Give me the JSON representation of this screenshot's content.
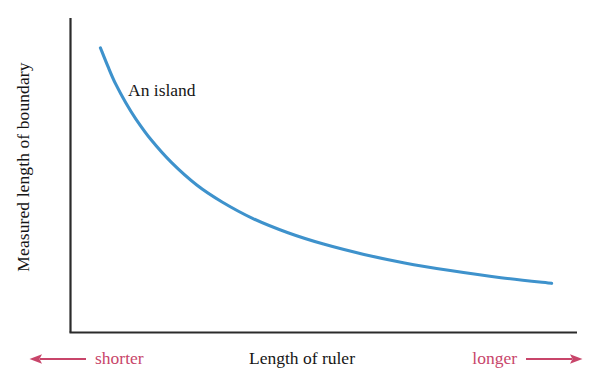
{
  "chart_data": {
    "type": "line",
    "title": "",
    "subtitle": "",
    "xlabel": "Length of ruler",
    "ylabel": "Measured length of boundary",
    "xlim": [
      0,
      1
    ],
    "ylim": [
      0,
      1
    ],
    "grid": false,
    "legend_position": "none",
    "axis_ticks": {
      "x": [],
      "y": []
    },
    "annotations": [
      {
        "text": "An island",
        "x": 0.12,
        "y": 0.84
      },
      {
        "text": "shorter",
        "x": 0.0,
        "y": -0.08,
        "color": "#c8456a",
        "arrow": "left"
      },
      {
        "text": "longer",
        "x": 1.0,
        "y": -0.08,
        "color": "#c8456a",
        "arrow": "right"
      }
    ],
    "series": [
      {
        "name": "An island",
        "color": "#3e92cc",
        "x": [
          0.06,
          0.075,
          0.09,
          0.11,
          0.13,
          0.16,
          0.2,
          0.25,
          0.3,
          0.36,
          0.43,
          0.5,
          0.58,
          0.66,
          0.75,
          0.85,
          0.95
        ],
        "y": [
          0.905,
          0.845,
          0.79,
          0.73,
          0.678,
          0.612,
          0.54,
          0.468,
          0.414,
          0.362,
          0.316,
          0.28,
          0.247,
          0.22,
          0.196,
          0.173,
          0.155
        ],
        "note": "Monotonically decreasing power-law style decay; measured boundary length falls as ruler length grows."
      }
    ]
  },
  "labels": {
    "y_axis_title": "Measured length of boundary",
    "x_axis_title": "Length of ruler",
    "curve_annotation": "An island",
    "shorter": "shorter",
    "longer": "longer"
  },
  "colors": {
    "curve": "#3e92cc",
    "axis": "#2b2b2b",
    "accent_red": "#c8456a",
    "text": "#161616",
    "background": "#ffffff"
  },
  "icons": {
    "left_arrow": "arrow-left-icon",
    "right_arrow": "arrow-right-icon"
  }
}
